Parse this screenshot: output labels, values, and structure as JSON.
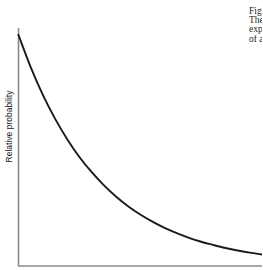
{
  "figure": {
    "name": "relative-probability-decay-figure",
    "background_color": "#ffffff",
    "axis_color": "#6e6e6e",
    "curve_color": "#1a1a1a"
  },
  "axes": {
    "y_title": "Relative probability",
    "x_title": "",
    "x_tick_labels": [],
    "y_tick_labels": []
  },
  "caption": {
    "lines": [
      "Figure",
      "The",
      "exponential",
      "of a",
      "decay"
    ]
  },
  "chart_data": {
    "type": "line",
    "title": "",
    "subtitle": "",
    "xlabel": "",
    "ylabel": "Relative probability",
    "grid": false,
    "legend": null,
    "legend_position": "none",
    "annotations": [],
    "xlim": [
      0,
      1
    ],
    "ylim": [
      0,
      1
    ],
    "x_tick_labels": [],
    "y_tick_labels": [],
    "series": [
      {
        "name": "Relative probability",
        "color": "#1a1a1a",
        "x": [
          0.0,
          0.05,
          0.1,
          0.15,
          0.2,
          0.25,
          0.3,
          0.35,
          0.4,
          0.45,
          0.5,
          0.55,
          0.6,
          0.65,
          0.7,
          0.75,
          0.8,
          0.85,
          0.9,
          0.95,
          1.0
        ],
        "y": [
          1.0,
          0.861,
          0.741,
          0.638,
          0.549,
          0.472,
          0.407,
          0.35,
          0.301,
          0.259,
          0.223,
          0.192,
          0.165,
          0.142,
          0.122,
          0.105,
          0.091,
          0.078,
          0.067,
          0.058,
          0.05
        ]
      }
    ]
  }
}
